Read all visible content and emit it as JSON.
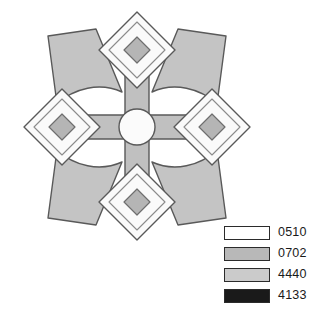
{
  "figure": {
    "name": "rosette-pattern",
    "background_color": "#ffffff",
    "outline_color": "#595959",
    "canvas": {
      "width": 321,
      "height": 331
    },
    "center": {
      "x": 137,
      "y": 127
    },
    "core_circle": {
      "name": "center-circle",
      "radius": 18,
      "fill": "#fbfbfb"
    },
    "spokes": [
      {
        "name": "spoke-up",
        "angle_deg": -90,
        "fill": "#c0c0c0"
      },
      {
        "name": "spoke-right",
        "angle_deg": 0,
        "fill": "#c0c0c0"
      },
      {
        "name": "spoke-down",
        "angle_deg": 90,
        "fill": "#c0c0c0"
      },
      {
        "name": "spoke-left",
        "angle_deg": 180,
        "fill": "#c0c0c0"
      }
    ],
    "diamonds": [
      {
        "name": "diamond-top",
        "cx": 137,
        "cy": 50,
        "half": 38,
        "fill": "#fafafa",
        "inner_half": 13,
        "inner_fill": "#b5b5b5"
      },
      {
        "name": "diamond-right",
        "cx": 212,
        "cy": 127,
        "half": 38,
        "fill": "#fafafa",
        "inner_half": 13,
        "inner_fill": "#b5b5b5"
      },
      {
        "name": "diamond-bottom",
        "cx": 137,
        "cy": 202,
        "half": 38,
        "fill": "#fafafa",
        "inner_half": 13,
        "inner_fill": "#b5b5b5"
      },
      {
        "name": "diamond-left",
        "cx": 62,
        "cy": 127,
        "half": 38,
        "fill": "#fafafa",
        "inner_half": 13,
        "inner_fill": "#b5b5b5"
      }
    ],
    "wings": [
      {
        "name": "wing-top-left",
        "fill": "#c4c4c4"
      },
      {
        "name": "wing-top-right",
        "fill": "#c4c4c4"
      },
      {
        "name": "wing-bottom-right",
        "fill": "#c4c4c4"
      },
      {
        "name": "wing-bottom-left",
        "fill": "#c4c4c4"
      }
    ]
  },
  "legend": {
    "name": "color-legend",
    "items": [
      {
        "label": "0510",
        "color": "#ffffff"
      },
      {
        "label": "0702",
        "color": "#b8b8b8"
      },
      {
        "label": "4440",
        "color": "#cbcbcb"
      },
      {
        "label": "4133",
        "color": "#1a1a1a"
      }
    ]
  }
}
